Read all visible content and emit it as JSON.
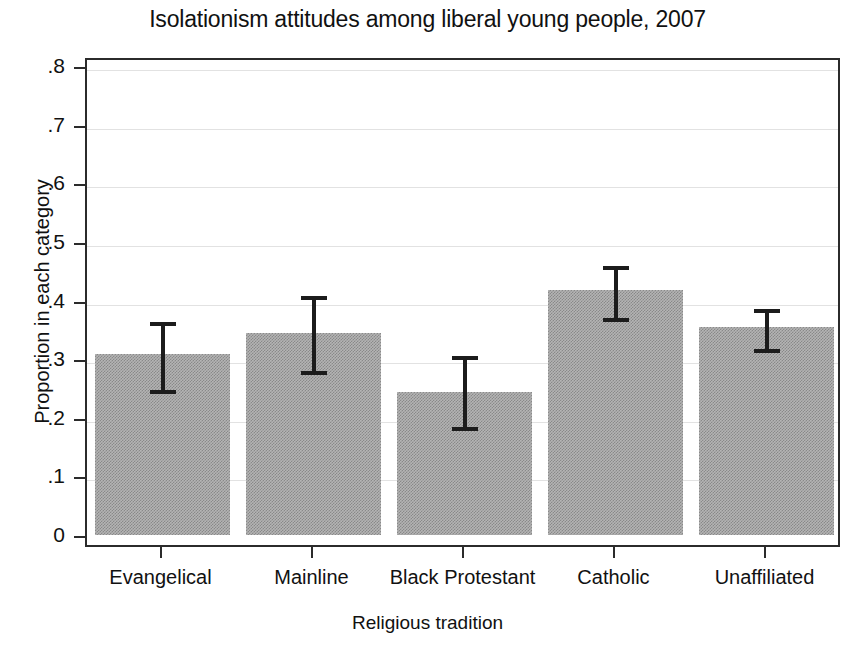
{
  "chart_data": {
    "type": "bar",
    "title": "Isolationism attitudes among liberal young people, 2007",
    "xlabel": "Religious tradition",
    "ylabel": "Proportion in each category",
    "categories": [
      "Evangelical",
      "Mainline",
      "Black Protestant",
      "Catholic",
      "Unaffiliated"
    ],
    "values": [
      0.308,
      0.344,
      0.244,
      0.418,
      0.355
    ],
    "error_low": [
      0.247,
      0.28,
      0.184,
      0.37,
      0.318
    ],
    "error_high": [
      0.37,
      0.415,
      0.313,
      0.466,
      0.392
    ],
    "ylim": [
      0,
      0.8
    ],
    "yticks": [
      0,
      0.1,
      0.2,
      0.3,
      0.4,
      0.5,
      0.6,
      0.7,
      0.8
    ],
    "ytick_labels": [
      "0",
      ".1",
      ".2",
      ".3",
      ".4",
      ".5",
      ".6",
      ".7",
      ".8"
    ],
    "grid": true,
    "legend": null,
    "bar_color": "#b4b4b4",
    "error_color": "#1c1c1c",
    "axis_color": "#2b2b2b",
    "grid_color": "#e2e2e2",
    "background": "#ffffff"
  }
}
